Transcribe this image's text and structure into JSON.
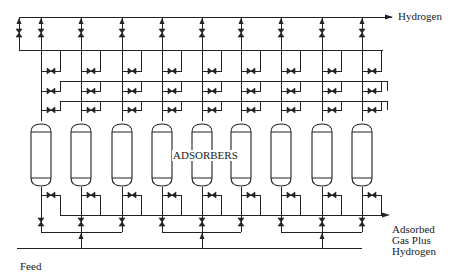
{
  "labels": {
    "product_outlet": "Hydrogen",
    "vessel_group": "ADSORBERS",
    "tail_gas_outlet": [
      "Adsorbed",
      "Gas Plus",
      "Hydrogen"
    ],
    "feed_inlet": "Feed"
  },
  "colors": {
    "line": "#222222",
    "background": "#ffffff"
  },
  "layout": {
    "vessel_columns_x": [
      41,
      81,
      122,
      162,
      202,
      241,
      281,
      322,
      362
    ],
    "extra_top_column_x": 19,
    "product_header_y": 17,
    "top_collector_y": 50,
    "equalization_headers_y": [
      71,
      91,
      110
    ],
    "vessel_top_y": 121,
    "vessel_bottom_y": 189,
    "vessel_half_width": 10,
    "bottom_valve_row_y": 205,
    "tail_gas_header_y": 215,
    "feed_distributor_y": 232,
    "feed_header_y": 248,
    "feed_groups": [
      [
        0,
        1,
        2
      ],
      [
        3,
        4,
        5
      ],
      [
        6,
        7,
        8
      ]
    ]
  },
  "diagram": {
    "type": "process-flow",
    "adsorber_count": 9
  }
}
